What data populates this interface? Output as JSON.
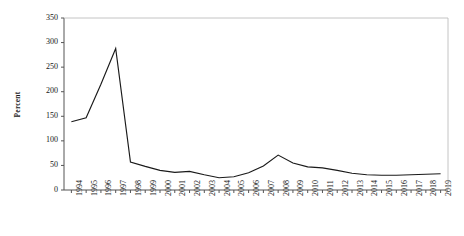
{
  "chart_data": {
    "type": "line",
    "title": "",
    "xlabel": "",
    "ylabel": "Percent",
    "ylim": [
      0,
      350
    ],
    "ytick_values": [
      0,
      50,
      100,
      150,
      200,
      250,
      300,
      350
    ],
    "grid": false,
    "legend": "none",
    "line_color": "#1a1a1a",
    "categories": [
      "1994",
      "1995",
      "1996",
      "1997",
      "1998",
      "1999",
      "2000",
      "2001",
      "2002",
      "2003",
      "2004",
      "2005",
      "2006",
      "2007",
      "2008",
      "2009",
      "2010",
      "2011",
      "2012",
      "2013",
      "2014",
      "2015",
      "2016",
      "2017",
      "2018",
      "2019"
    ],
    "values": [
      139,
      147,
      215,
      288,
      57,
      48,
      40,
      36,
      38,
      31,
      25,
      27,
      35,
      49,
      71,
      55,
      47,
      45,
      40,
      34,
      31,
      30,
      30,
      31,
      32,
      33
    ]
  }
}
